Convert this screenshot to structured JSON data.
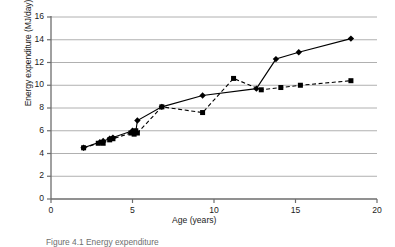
{
  "chart_data": {
    "type": "line",
    "title": "",
    "xlabel": "Age (years)",
    "ylabel": "Energy expenditure (MJ/day)",
    "xlim": [
      0,
      20
    ],
    "ylim": [
      0,
      16
    ],
    "xticks": [
      0,
      5,
      10,
      15,
      20
    ],
    "yticks": [
      0,
      2,
      4,
      6,
      8,
      10,
      12,
      14,
      16
    ],
    "grid": "horizontal",
    "legend": "none",
    "series": [
      {
        "name": "Boys",
        "marker": "diamond",
        "linestyle": "solid",
        "color": "#000000",
        "points": [
          [
            2.0,
            4.5
          ],
          [
            3.0,
            5.0
          ],
          [
            3.2,
            5.1
          ],
          [
            3.6,
            5.3
          ],
          [
            3.8,
            5.4
          ],
          [
            5.0,
            6.0
          ],
          [
            5.2,
            5.9
          ],
          [
            5.3,
            6.9
          ],
          [
            6.8,
            8.1
          ],
          [
            9.3,
            9.1
          ],
          [
            12.6,
            9.7
          ],
          [
            13.8,
            12.3
          ],
          [
            15.2,
            12.9
          ],
          [
            18.4,
            14.1
          ]
        ]
      },
      {
        "name": "Girls",
        "marker": "square",
        "linestyle": "dashed",
        "color": "#000000",
        "points": [
          [
            2.0,
            4.5
          ],
          [
            2.9,
            4.9
          ],
          [
            3.2,
            4.9
          ],
          [
            3.6,
            5.2
          ],
          [
            3.8,
            5.3
          ],
          [
            4.9,
            5.8
          ],
          [
            5.1,
            5.7
          ],
          [
            5.2,
            6.0
          ],
          [
            5.3,
            5.8
          ],
          [
            6.8,
            8.1
          ],
          [
            9.3,
            7.6
          ],
          [
            11.2,
            10.6
          ],
          [
            12.9,
            9.6
          ],
          [
            14.1,
            9.8
          ],
          [
            15.3,
            10.0
          ],
          [
            18.4,
            10.4
          ]
        ]
      }
    ]
  },
  "caption": {
    "text": "Figure 4.1  Energy expenditure"
  }
}
